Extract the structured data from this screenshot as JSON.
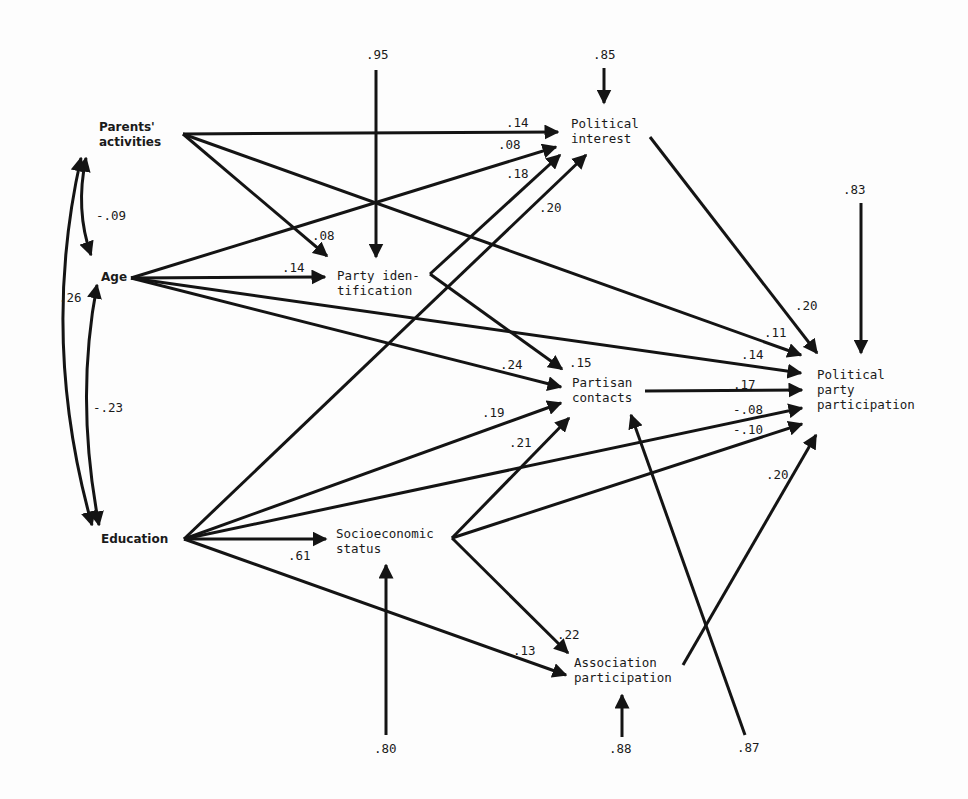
{
  "nodes": {
    "parents": {
      "line1": "Parents'",
      "line2": "activities"
    },
    "age": {
      "line1": "Age"
    },
    "education": {
      "line1": "Education"
    },
    "party_id": {
      "line1": "Party iden-",
      "line2": "tification"
    },
    "political_interest": {
      "line1": "Political",
      "line2": "interest"
    },
    "partisan_contacts": {
      "line1": "Partisan",
      "line2": "contacts"
    },
    "ses": {
      "line1": "Socioeconomic",
      "line2": "status"
    },
    "association": {
      "line1": "Association",
      "line2": "participation"
    },
    "ppp": {
      "line1": "Political",
      "line2": "party",
      "line3": "participation"
    }
  },
  "correlations": {
    "parents_age": "-.09",
    "parents_education": ".26",
    "age_education": "-.23"
  },
  "paths": {
    "parents_interest": ".14",
    "age_interest": ".08",
    "education_interest": ".18",
    "partyid_interest": ".20",
    "parents_partyid": ".08",
    "age_partyid": ".14",
    "interest_ppp": ".20",
    "parents_ppp": ".11",
    "age_ppp": ".14",
    "partyid_contacts": ".15",
    "age_contacts": ".24",
    "education_contacts": ".19",
    "ses_contacts": ".21",
    "contacts_ppp": ".17",
    "education_ppp": "-.08",
    "ses_ppp": "-.10",
    "association_ppp": ".20",
    "education_ses": ".61",
    "ses_association": ".22",
    "education_association": ".13"
  },
  "residuals": {
    "party_id": ".95",
    "political_interest": ".85",
    "ppp": ".83",
    "ses": ".80",
    "association": ".88",
    "partisan_contacts": ".87"
  }
}
